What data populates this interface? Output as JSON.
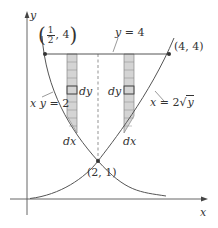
{
  "figure": {
    "axes": {
      "x_label": "x",
      "y_label": "y"
    },
    "curves": [
      {
        "id": "hyperbola",
        "equation": "xy = 2",
        "label": "xy = 2"
      },
      {
        "id": "parabola",
        "equation": "x = 2√y",
        "label_main": "x = 2",
        "label_radicand": "y"
      },
      {
        "id": "line",
        "equation": "y = 4",
        "label": "y = 4"
      }
    ],
    "points": [
      {
        "label_num": "1",
        "label_den": "2",
        "label_rest": ", 4",
        "x": 0.5,
        "y": 4
      },
      {
        "label": "(4, 4)",
        "x": 4,
        "y": 4
      },
      {
        "label": "(2, 1)",
        "x": 2,
        "y": 1
      }
    ],
    "strips": {
      "left": {
        "element_label": "dy",
        "width_label": "dx"
      },
      "right": {
        "element_label": "dy",
        "width_label": "dx"
      }
    },
    "colors": {
      "line": "#555555",
      "strip_fill": "#d4d4d4",
      "strip_stroke": "#777777",
      "text": "#333333"
    }
  }
}
